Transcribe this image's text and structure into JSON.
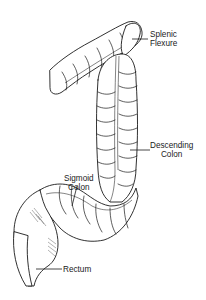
{
  "figure": {
    "line_color": "#1a1a1a",
    "background": "#ffffff"
  },
  "labels": {
    "splenic_flexure": {
      "line1": "Splenic",
      "line2": "Flexure"
    },
    "descending_colon": {
      "line1": "Descending",
      "line2": "Colon"
    },
    "sigmoid_colon": {
      "line1": "Sigmoid",
      "line2": "Colon"
    },
    "rectum": {
      "line1": "Rectum"
    }
  }
}
